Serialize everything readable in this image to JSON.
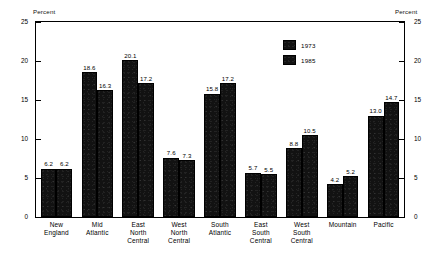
{
  "chart_data": {
    "type": "bar",
    "title": "",
    "subtitle": "",
    "xlabel": "",
    "ylabel": "Percent",
    "ylabel_right": "Percent",
    "ylim": [
      0,
      25
    ],
    "yticks": [
      0,
      5,
      10,
      15,
      20,
      25
    ],
    "ytick_labels": [
      "0",
      "5",
      "10",
      "15",
      "20",
      "25"
    ],
    "grid": false,
    "legend_position": "upper-right-inside",
    "categories": [
      "New England",
      "Mid Atlantic",
      "East North Central",
      "West North Central",
      "South Atlantic",
      "East South Central",
      "West South Central",
      "Mountain",
      "Pacific"
    ],
    "category_lines": [
      [
        "New",
        "England"
      ],
      [
        "Mid",
        "Atlantic"
      ],
      [
        "East",
        "North",
        "Central"
      ],
      [
        "West",
        "North",
        "Central"
      ],
      [
        "South",
        "Atlantic"
      ],
      [
        "East",
        "South",
        "Central"
      ],
      [
        "West",
        "South",
        "Central"
      ],
      [
        "Mountain"
      ],
      [
        "Pacific"
      ]
    ],
    "series": [
      {
        "name": "1973",
        "values": [
          6.2,
          18.6,
          20.1,
          7.6,
          15.8,
          5.7,
          8.8,
          4.2,
          13.0
        ],
        "labels": [
          "6.2",
          "18.6",
          "20.1",
          "7.6",
          "15.8",
          "5.7",
          "8.8",
          "4.2",
          "13.0"
        ],
        "color": "#121212"
      },
      {
        "name": "1985",
        "values": [
          6.2,
          16.3,
          17.2,
          7.3,
          17.2,
          5.5,
          10.5,
          5.2,
          14.7
        ],
        "labels": [
          "6.2",
          "16.3",
          "17.2",
          "7.3",
          "17.2",
          "5.5",
          "10.5",
          "5.2",
          "14.7"
        ],
        "color": "#121212"
      }
    ]
  },
  "legend": {
    "entries": [
      {
        "label": "1973"
      },
      {
        "label": "1985"
      }
    ]
  },
  "colors": {
    "bar_fill": "#121212",
    "axis": "#000000",
    "background": "#ffffff"
  }
}
